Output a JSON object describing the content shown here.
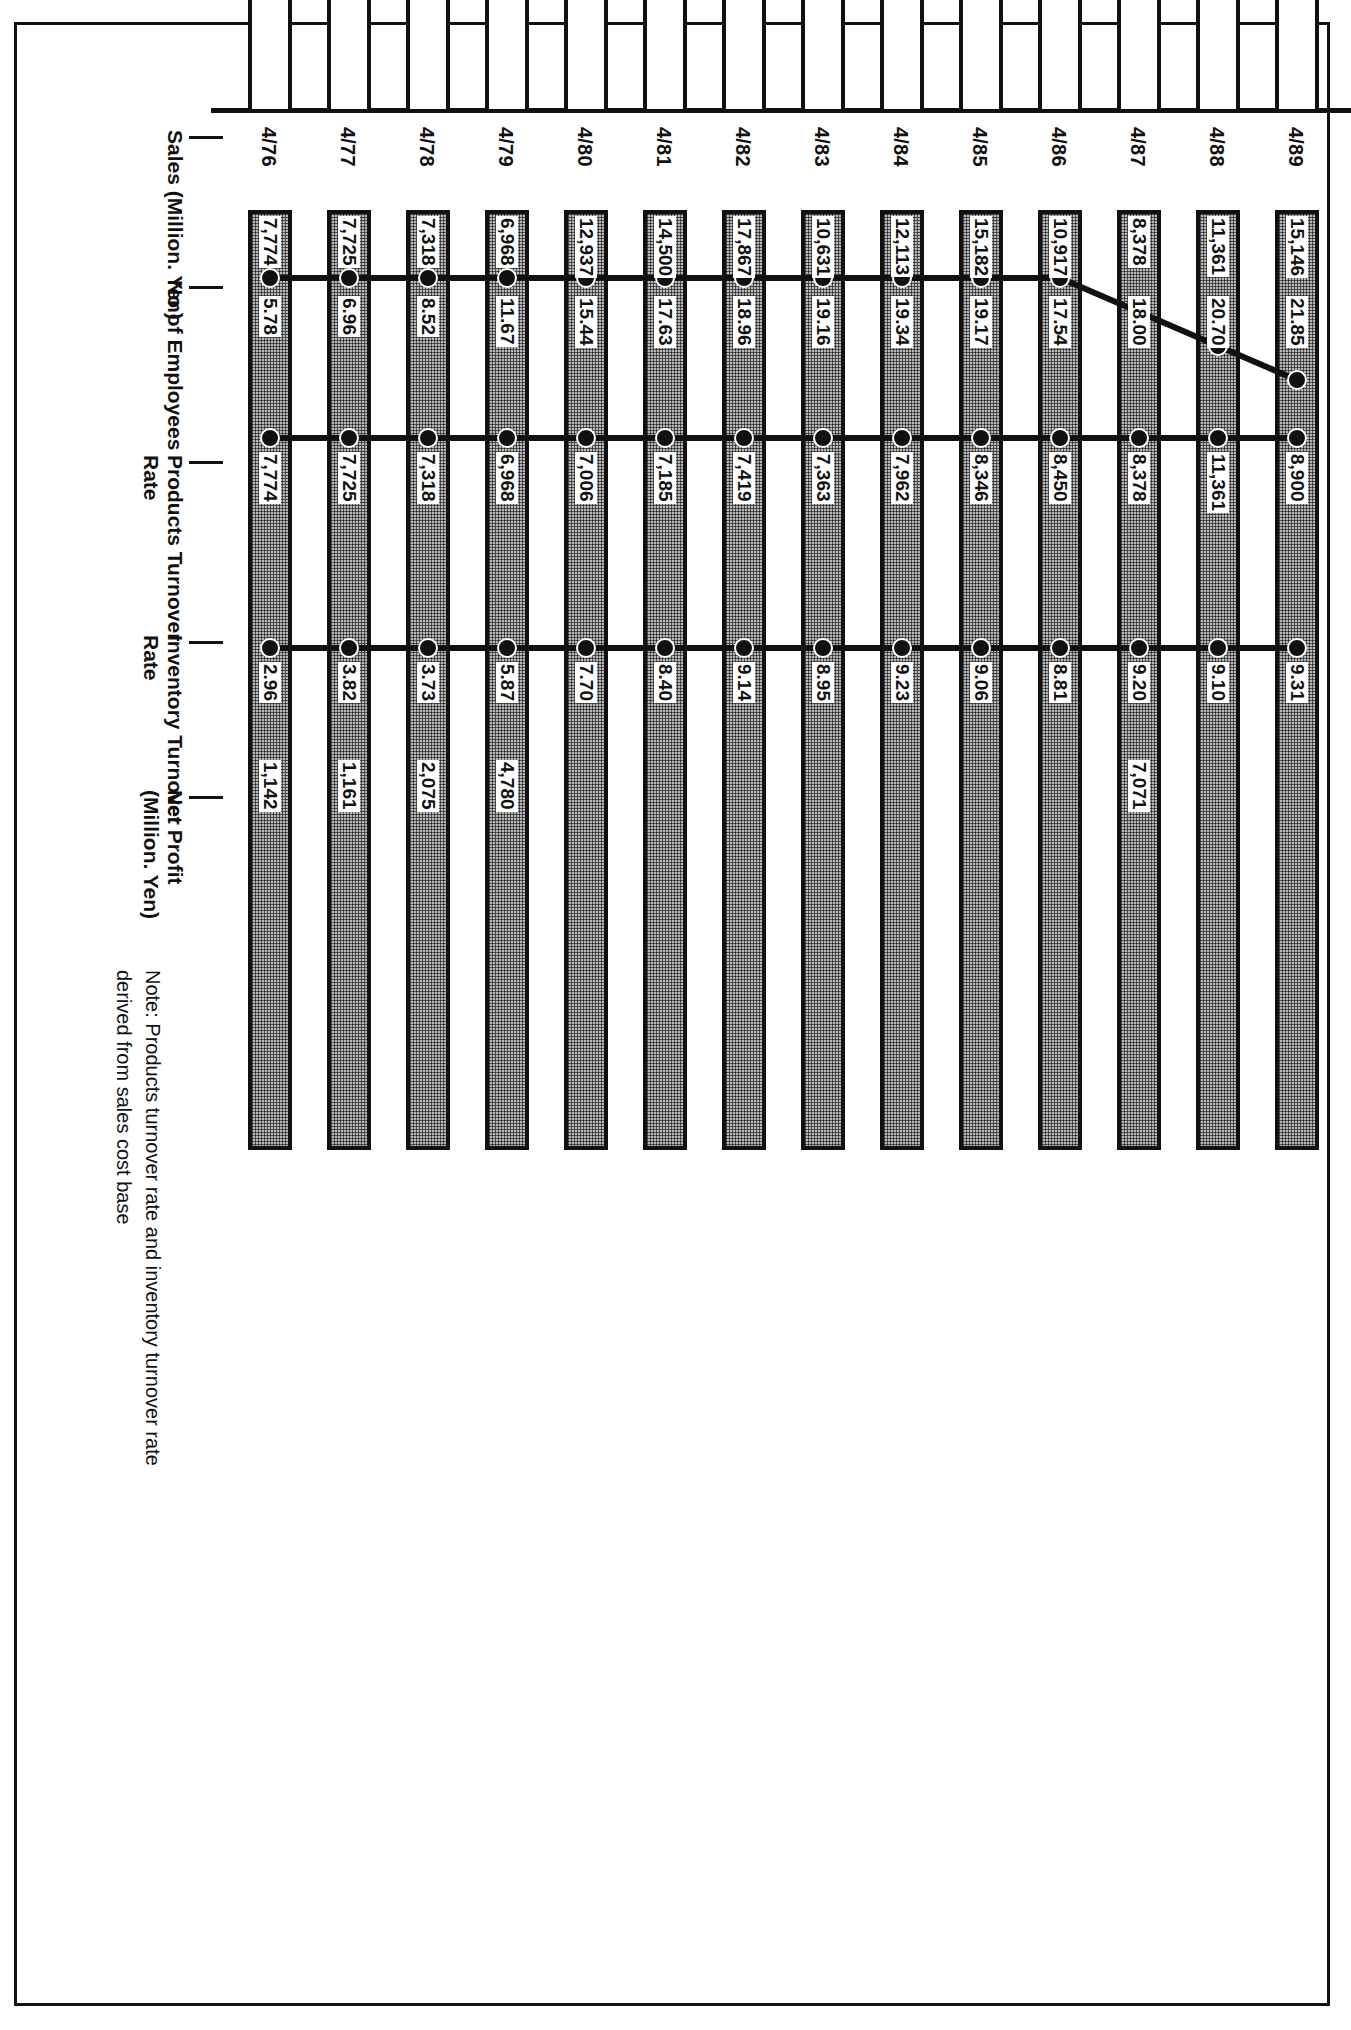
{
  "chart_data": {
    "type": "bar",
    "title": "",
    "xlabel": "",
    "ylabel": "",
    "orientation": "horizontal",
    "categories": [
      "4/89",
      "4/88",
      "4/87",
      "4/86",
      "4/85",
      "4/84",
      "4/83",
      "4/82",
      "4/81",
      "4/80",
      "4/79",
      "4/78",
      "4/77",
      "4/76"
    ],
    "series": [
      {
        "name": "Sales (Million. Yen)",
        "type": "bar",
        "style": "outline",
        "values": [
          301163,
          265225,
          246243,
          250625,
          237836,
          204308,
          185575,
          197270,
          182871,
          167717,
          151314,
          123628,
          125577,
          111879
        ],
        "labels": [
          "301,163",
          "265,225",
          "246,243",
          "250,625",
          "237,836",
          "204,308",
          "185,575",
          "197,270",
          "182,871",
          "167,717",
          "151,314",
          "123,628",
          "125,577",
          "111,879"
        ]
      },
      {
        "name": "No of Employees",
        "type": "bar",
        "style": "hatched",
        "values": [
          15146,
          11361,
          8378,
          10917,
          15182,
          12113,
          10631,
          17867,
          14500,
          12937,
          6968,
          7318,
          7725,
          7774
        ],
        "labels": [
          "15,146",
          "11,361",
          "8,378",
          "10,917",
          "15,182",
          "12,113",
          "10,631",
          "17,867",
          "14,500",
          "12,937",
          "6,968",
          "7,318",
          "7,725",
          "7,774"
        ]
      },
      {
        "name": "Products Turnover\nRate",
        "type": "line",
        "values": [
          21.85,
          20.7,
          18.0,
          17.54,
          19.17,
          19.34,
          19.16,
          18.96,
          17.63,
          15.44,
          11.67,
          8.52,
          6.96,
          5.78
        ],
        "labels": [
          "21.85",
          "20.70",
          "18.00",
          "17.54",
          "19.17",
          "19.34",
          "19.16",
          "18.96",
          "17.63",
          "15.44",
          "11.67",
          "8.52",
          "6.96",
          "5.78"
        ]
      },
      {
        "name": "Inventory Turnover\nRate",
        "type": "line",
        "values": [
          8900,
          11361,
          8378,
          8450,
          8346,
          7962,
          7363,
          7419,
          7185,
          7006,
          6968,
          7318,
          7725,
          7774
        ],
        "labels": [
          "8,900",
          "11,361",
          "8,378",
          "8,450",
          "8,346",
          "7,962",
          "7,363",
          "7,419",
          "7,185",
          "7,006",
          "6,968",
          "7,318",
          "7,725",
          "7,774"
        ]
      },
      {
        "name": "Net Profit\n(Million. Yen)",
        "type": "bar",
        "style": "hatched",
        "values": [
          9.31,
          9.1,
          9.2,
          8.81,
          9.06,
          9.23,
          8.95,
          9.14,
          8.4,
          7.7,
          5.87,
          3.73,
          3.82,
          2.96
        ],
        "labels": [
          "9.31",
          "9.10",
          "9.20",
          "8.81",
          "9.06",
          "9.23",
          "8.95",
          "9.14",
          "8.40",
          "7.70",
          "5.87",
          "3.73",
          "3.82",
          "2.96"
        ]
      }
    ],
    "net_profit_values": [
      null,
      null,
      7071,
      null,
      null,
      null,
      null,
      null,
      null,
      null,
      4780,
      2075,
      1161,
      1142
    ],
    "net_profit_labels": [
      "",
      "",
      "7,071",
      "",
      "",
      "",
      "",
      "",
      "",
      "",
      "4,780",
      "2,075",
      "1,161",
      "1,142"
    ],
    "rows": [
      {
        "year": "4/89",
        "sales": "301,163",
        "employees": "15,146",
        "products_turnover": "21.85",
        "inventory_turnover": "8,900",
        "inv_rate": "9.31",
        "net_profit": ""
      },
      {
        "year": "4/88",
        "sales": "265,225",
        "employees": "11,361",
        "products_turnover": "20.70",
        "inventory_turnover": "11,361",
        "inv_rate": "9.10",
        "net_profit": ""
      },
      {
        "year": "4/87",
        "sales": "246,243",
        "employees": "8,378",
        "products_turnover": "18.00",
        "inventory_turnover": "8,378",
        "inv_rate": "9.20",
        "net_profit": "7,071"
      },
      {
        "year": "4/86",
        "sales": "250,625",
        "employees": "10,917",
        "products_turnover": "17.54",
        "inventory_turnover": "8,450",
        "inv_rate": "8.81",
        "net_profit": ""
      },
      {
        "year": "4/85",
        "sales": "237,836",
        "employees": "15,182",
        "products_turnover": "19.17",
        "inventory_turnover": "8,346",
        "inv_rate": "9.06",
        "net_profit": ""
      },
      {
        "year": "4/84",
        "sales": "204,308",
        "employees": "12,113",
        "products_turnover": "19.34",
        "inventory_turnover": "7,962",
        "inv_rate": "9.23",
        "net_profit": ""
      },
      {
        "year": "4/83",
        "sales": "185,575",
        "employees": "10,631",
        "products_turnover": "19.16",
        "inventory_turnover": "7,363",
        "inv_rate": "8.95",
        "net_profit": ""
      },
      {
        "year": "4/82",
        "sales": "197,270",
        "employees": "17,867",
        "products_turnover": "18.96",
        "inventory_turnover": "7,419",
        "inv_rate": "9.14",
        "net_profit": ""
      },
      {
        "year": "4/81",
        "sales": "182,871",
        "employees": "14,500",
        "products_turnover": "17.63",
        "inventory_turnover": "7,185",
        "inv_rate": "8.40",
        "net_profit": ""
      },
      {
        "year": "4/80",
        "sales": "167,717",
        "employees": "12,937",
        "products_turnover": "15.44",
        "inventory_turnover": "7,006",
        "inv_rate": "7.70",
        "net_profit": ""
      },
      {
        "year": "4/79",
        "sales": "151,314",
        "employees": "6,968",
        "products_turnover": "11.67",
        "inventory_turnover": "6,968",
        "inv_rate": "5.87",
        "net_profit": "4,780"
      },
      {
        "year": "4/78",
        "sales": "123,628",
        "employees": "7,318",
        "products_turnover": "8.52",
        "inventory_turnover": "7,318",
        "inv_rate": "3.73",
        "net_profit": "2,075"
      },
      {
        "year": "4/77",
        "sales": "125,577",
        "employees": "7,725",
        "products_turnover": "6.96",
        "inventory_turnover": "7,725",
        "inv_rate": "3.82",
        "net_profit": "1,161"
      },
      {
        "year": "4/76",
        "sales": "111,879",
        "employees": "7,774",
        "products_turnover": "5.78",
        "inventory_turnover": "7,774",
        "inv_rate": "2.96",
        "net_profit": "1,142"
      }
    ],
    "legend": [
      "Sales (Million. Yen)",
      "No of Employees",
      "Products Turnover Rate",
      "Inventory Turnover Rate",
      "Net Profit (Million. Yen)"
    ],
    "grid": false,
    "legend_position": "bottom-left"
  },
  "series_labels": {
    "sales": "Sales (Million. Yen)",
    "employees": "No of Employees",
    "products_turnover": "Products Turnover\nRate",
    "inventory_turnover": "Inventory Turnover\nRate",
    "net_profit": "Net Profit\n(Million. Yen)"
  },
  "note": {
    "text": "Note: Products turnover rate and inventory turnover rate\n         derived from sales cost base"
  }
}
